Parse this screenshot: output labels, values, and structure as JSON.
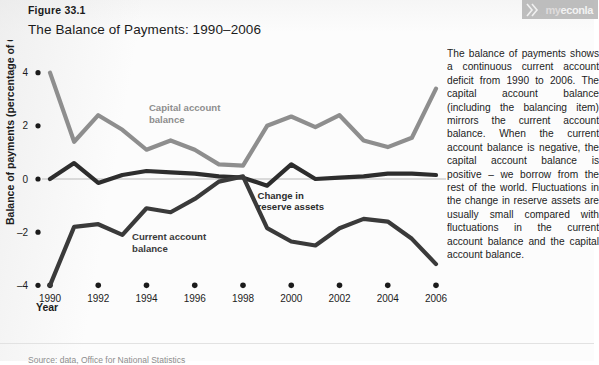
{
  "figure": {
    "number": "Figure 33.1",
    "title": "The Balance of Payments: 1990–2006",
    "source_note": "Source: data, Office for National Statistics"
  },
  "brand": {
    "name_prefix": "my",
    "name_main": "econla",
    "mark_icon": "double-chevron-icon"
  },
  "sidebar": {
    "paragraph": "The balance of payments shows a continuous current account deficit from 1990 to 2006. The capital account balance (including the balancing item) mirrors the current account balance. When the current account balance is negative, the capital account balance is positive – we borrow from the rest of the world. Fluctuations in the change in reserve assets are usually small compared with fluctuations in the current account balance and the capital account balance."
  },
  "chart_data": {
    "type": "line",
    "title": "The Balance of Payments: 1990–2006",
    "xlabel": "Year",
    "ylabel": "Balance of payments (percentage of GDP)",
    "x": [
      1990,
      1991,
      1992,
      1993,
      1994,
      1995,
      1996,
      1997,
      1998,
      1999,
      2000,
      2001,
      2002,
      2003,
      2004,
      2005,
      2006
    ],
    "xticks": [
      1990,
      1992,
      1994,
      1996,
      1998,
      2000,
      2002,
      2004,
      2006
    ],
    "yticks": [
      4,
      2,
      0,
      -2,
      -4
    ],
    "ylim": [
      -4.4,
      4.4
    ],
    "xlim": [
      1990,
      2006
    ],
    "grid": false,
    "zero_line": true,
    "legend": "inline-annotations",
    "series": [
      {
        "name": "Capital account balance",
        "color": "#8e8e8e",
        "label_x": 1994.1,
        "label_y": 2.55,
        "values": [
          4.0,
          1.4,
          2.4,
          1.85,
          1.1,
          1.45,
          1.1,
          0.55,
          0.5,
          2.0,
          2.35,
          1.95,
          2.4,
          1.45,
          1.2,
          1.55,
          3.4
        ]
      },
      {
        "name": "Change in reserve assets",
        "color": "#2d2d2d",
        "label_x": 1998.6,
        "label_y": -0.75,
        "values": [
          0.0,
          0.6,
          -0.15,
          0.15,
          0.3,
          0.25,
          0.2,
          0.1,
          0.05,
          -0.25,
          0.55,
          0.0,
          0.05,
          0.1,
          0.2,
          0.2,
          0.15
        ]
      },
      {
        "name": "Current account balance",
        "color": "#3a3a3a",
        "label_x": 1993.4,
        "label_y": -2.3,
        "values": [
          -4.0,
          -1.8,
          -1.7,
          -2.1,
          -1.1,
          -1.25,
          -0.75,
          -0.1,
          0.1,
          -1.85,
          -2.35,
          -2.5,
          -1.85,
          -1.5,
          -1.6,
          -2.25,
          -3.2
        ]
      }
    ]
  }
}
